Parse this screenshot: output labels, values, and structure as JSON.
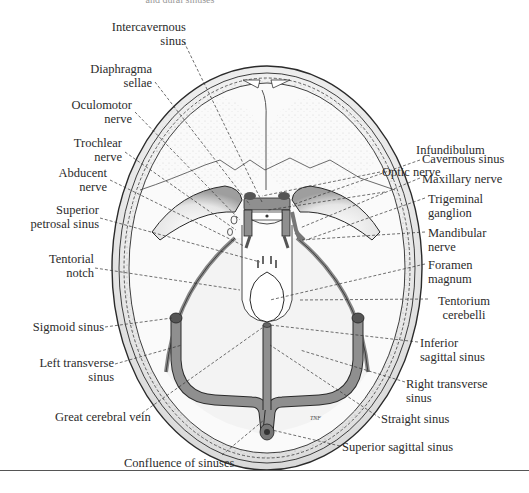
{
  "caption_fragment": "and dural sinuses",
  "labels": {
    "intercavernous_sinus": [
      "Intercavernous",
      "sinus"
    ],
    "diaphragma_sellae": [
      "Diaphragma",
      "sellae"
    ],
    "oculomotor_nerve": [
      "Oculomotor",
      "nerve"
    ],
    "trochlear_nerve": [
      "Trochlear",
      "nerve"
    ],
    "abducent_nerve": [
      "Abducent",
      "nerve"
    ],
    "superior_petrosal_sinus": [
      "Superior",
      "petrosal sinus"
    ],
    "tentorial_notch": [
      "Tentorial",
      "notch"
    ],
    "sigmoid_sinus": [
      "Sigmoid sinus"
    ],
    "left_transverse_sinus": [
      "Left transverse",
      "sinus"
    ],
    "great_cerebral_vein": [
      "Great cerebral vein"
    ],
    "confluence_of_sinuses": [
      "Confluence of sinuses"
    ],
    "optic_nerve": [
      "Optic nerve"
    ],
    "infundibulum": [
      "Infundibulum"
    ],
    "cavernous_sinus": [
      "Cavernous sinus"
    ],
    "maxillary_nerve": [
      "Maxillary nerve"
    ],
    "trigeminal_ganglion": [
      "Trigeminal",
      "ganglion"
    ],
    "mandibular_nerve": [
      "Mandibular",
      "nerve"
    ],
    "foramen_magnum": [
      "Foramen",
      "magnum"
    ],
    "tentorium_cerebelli": [
      "Tentorium",
      "cerebelli"
    ],
    "inferior_sagittal_sinus": [
      "Inferior",
      "sagittal sinus"
    ],
    "right_transverse_sinus": [
      "Right transverse",
      "sinus"
    ],
    "straight_sinus": [
      "Straight sinus"
    ],
    "superior_sagittal_sinus": [
      "Superior sagittal sinus"
    ]
  },
  "artist_signature": "TNF",
  "colors": {
    "sinus_fill": "#8f8f8f",
    "line": "#2a2a2a",
    "stipple": "#b5b5b5",
    "background": "#ffffff"
  }
}
